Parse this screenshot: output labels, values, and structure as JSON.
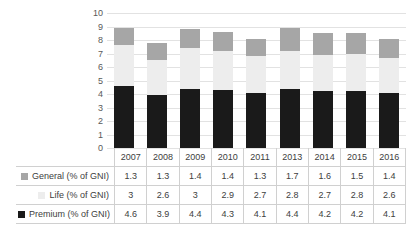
{
  "chart_data": {
    "type": "bar",
    "subtype": "stacked-column",
    "title": "",
    "xlabel": "",
    "ylabel": "",
    "ylim": [
      0,
      10
    ],
    "ytick_step": 1,
    "yticks": [
      10,
      9,
      8,
      7,
      6,
      5,
      4,
      3,
      2,
      1,
      0
    ],
    "grid": true,
    "legend_position": "data-table-left-column",
    "categories": [
      "2007",
      "2008",
      "2009",
      "2010",
      "2011",
      "2013",
      "2014",
      "2015",
      "2016"
    ],
    "series": [
      {
        "name": "Premium (% of GNI)",
        "color": "#1a1a1a",
        "stack_order": 0,
        "values": [
          4.6,
          3.9,
          4.4,
          4.3,
          4.1,
          4.4,
          4.2,
          4.2,
          4.1
        ],
        "labels": [
          "4.6",
          "3.9",
          "4.4",
          "4.3",
          "4.1",
          "4.4",
          "4.2",
          "4.2",
          "4.1"
        ]
      },
      {
        "name": "Life (% of GNI)",
        "color": "#ededed",
        "stack_order": 1,
        "values": [
          3,
          2.6,
          3,
          2.9,
          2.7,
          2.8,
          2.7,
          2.8,
          2.6
        ],
        "labels": [
          "3",
          "2.6",
          "3",
          "2.9",
          "2.7",
          "2.8",
          "2.7",
          "2.8",
          "2.6"
        ]
      },
      {
        "name": "General (% of GNI)",
        "color": "#a6a6a6",
        "stack_order": 2,
        "values": [
          1.3,
          1.3,
          1.4,
          1.4,
          1.3,
          1.7,
          1.6,
          1.5,
          1.4
        ],
        "labels": [
          "1.3",
          "1.3",
          "1.4",
          "1.4",
          "1.3",
          "1.7",
          "1.6",
          "1.5",
          "1.4"
        ]
      }
    ],
    "totals": [
      8.9,
      7.8,
      8.8,
      8.6,
      8.1,
      8.9,
      8.5,
      8.5,
      8.1
    ]
  },
  "table": {
    "header": [
      "",
      "2007",
      "2008",
      "2009",
      "2010",
      "2011",
      "2013",
      "2014",
      "2015",
      "2016"
    ],
    "rows": [
      {
        "label": "General (% of GNI)",
        "marker_color": "#a6a6a6",
        "values": [
          "1.3",
          "1.3",
          "1.4",
          "1.4",
          "1.3",
          "1.7",
          "1.6",
          "1.5",
          "1.4"
        ]
      },
      {
        "label": "Life (% of GNI)",
        "marker_color": "#ededed",
        "values": [
          "3",
          "2.6",
          "3",
          "2.9",
          "2.7",
          "2.8",
          "2.7",
          "2.8",
          "2.6"
        ]
      },
      {
        "label": "Premium (% of GNI)",
        "marker_color": "#1a1a1a",
        "values": [
          "4.6",
          "3.9",
          "4.4",
          "4.3",
          "4.1",
          "4.4",
          "4.2",
          "4.2",
          "4.1"
        ]
      }
    ]
  },
  "colors": {
    "general": "#a6a6a6",
    "life": "#ededed",
    "premium": "#1a1a1a",
    "gridline": "#e2e2e2",
    "border": "#d0d0d0",
    "text": "#404040",
    "axis_text": "#595959",
    "background": "#ffffff"
  }
}
